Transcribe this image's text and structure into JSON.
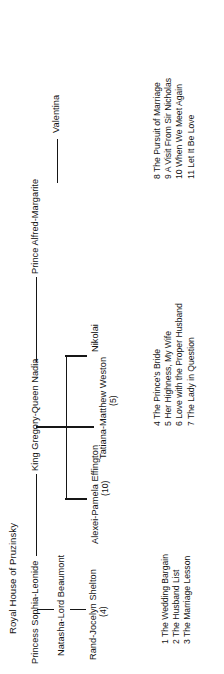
{
  "diagram": {
    "title": "Royal House of Pruzinsky",
    "orientation": "rotated-90-ccw",
    "ink_color": "#161616",
    "background": "#ffffff"
  },
  "tree": {
    "root": {
      "label": "King Gregory-Queen Nadia",
      "name": "king-gregory-queen-nadia"
    },
    "children": [
      {
        "label": "Princess Sophia-Leonide",
        "name": "princess-sophia-leonide",
        "children": [
          {
            "label": "Natasha-Lord Beaumont",
            "name": "natasha-lord-beaumont",
            "children": [
              {
                "label": "Rand-Jocelyn Shelton",
                "count": "(4)",
                "name": "rand-jocelyn-shelton"
              }
            ]
          }
        ]
      },
      {
        "label": "Alexei-Pamela Effington",
        "count": "(10)",
        "name": "alexei-pamela-effington"
      },
      {
        "label": "Tatiana-Matthew Weston",
        "count": "(5)",
        "name": "tatiana-matthew-weston"
      },
      {
        "label": "Nikolai",
        "name": "nikolai"
      },
      {
        "label": "Prince Alfred-Margarite",
        "name": "prince-alfred-margarite",
        "children": [
          {
            "label": "Valentina",
            "name": "valentina"
          }
        ]
      }
    ]
  },
  "book_lists": {
    "sophia_line": [
      {
        "number": "1",
        "title": "The Wedding Bargain"
      },
      {
        "number": "2",
        "title": "The Husband List"
      },
      {
        "number": "3",
        "title": "The Marriage Lesson"
      }
    ],
    "effington_line": [
      {
        "number": "4",
        "title": "The Prince's Bride"
      },
      {
        "number": "5",
        "title": "Her Highness, My Wife"
      },
      {
        "number": "6",
        "title": "Love with the Proper Husband"
      },
      {
        "number": "7",
        "title": "The Lady in Question"
      }
    ],
    "alfred_line": [
      {
        "number": "8",
        "title": "The Pursuit of Marriage"
      },
      {
        "number": "9",
        "title": "A Visit From Sir Nicholas"
      },
      {
        "number": "10",
        "title": "When We Meet Again"
      },
      {
        "number": "11",
        "title": "Let It Be Love"
      }
    ]
  }
}
